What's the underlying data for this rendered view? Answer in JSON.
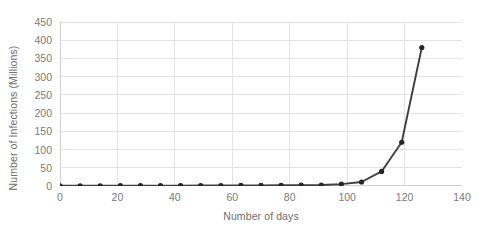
{
  "chart_data": {
    "type": "line",
    "title": "",
    "xlabel": "Number of days",
    "ylabel": "Number of Infections (Millions)",
    "xlim": [
      0,
      140
    ],
    "ylim": [
      0,
      450
    ],
    "xticks": [
      0,
      20,
      40,
      60,
      80,
      100,
      120,
      140
    ],
    "yticks": [
      0,
      50,
      100,
      150,
      200,
      250,
      300,
      350,
      400,
      450
    ],
    "grid": "horizontal-and-vertical",
    "legend": "none",
    "series": [
      {
        "name": "Infections",
        "marker": "circle",
        "color": "#3f3f3f",
        "x": [
          0,
          7,
          14,
          21,
          28,
          35,
          42,
          49,
          56,
          63,
          70,
          77,
          84,
          91,
          98,
          105,
          112,
          119,
          126
        ],
        "values": [
          0.5,
          0.6,
          0.7,
          0.8,
          0.9,
          1.0,
          1.1,
          1.2,
          1.3,
          1.5,
          1.7,
          2.0,
          2.3,
          2.8,
          5,
          11,
          40,
          120,
          380
        ]
      }
    ]
  },
  "axis": {
    "x_title": "Number of days",
    "y_title": "Number of Infections (Millions)"
  },
  "colors": {
    "line": "#3f3f3f",
    "marker": "#262626",
    "gridline": "#e3e3e3",
    "axis_line": "#cfcfcf",
    "tick_text": "#7a7a7a",
    "title_text": "#6d6d6d",
    "background": "#ffffff"
  }
}
